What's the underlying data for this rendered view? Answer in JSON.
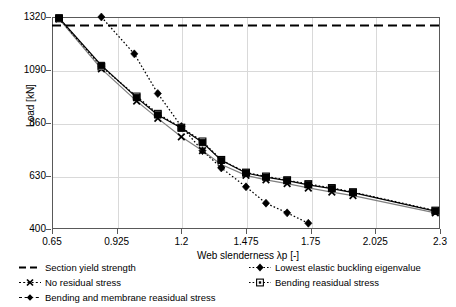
{
  "chart_data": {
    "type": "line",
    "title": "",
    "xlabel": "Web slenderness λp [-]",
    "ylabel": "Load [kN]",
    "xlim": [
      0.65,
      2.3
    ],
    "ylim": [
      400,
      1320
    ],
    "xticks": [
      "0.65",
      "0.925",
      "1.2",
      "1.475",
      "1.75",
      "2.025",
      "2.3"
    ],
    "xtick_values": [
      0.65,
      0.925,
      1.2,
      1.475,
      1.75,
      2.025,
      2.3
    ],
    "yticks": [
      "400",
      "630",
      "860",
      "1090",
      "1320"
    ],
    "ytick_values": [
      400,
      630,
      860,
      1090,
      1320
    ],
    "grid": "horizontal-and-vertical",
    "legend_position": "below-axes",
    "series": [
      {
        "name": "Section yield strength",
        "style": "dashed",
        "marker": "none",
        "color": "#000000",
        "constant_value": 1283,
        "x": [
          0.65,
          2.3
        ],
        "values": [
          1283,
          1283
        ]
      },
      {
        "name": "Lowest elastic buckling eigenvalue",
        "style": "dotted",
        "marker": "diamond",
        "color": "#000000",
        "x": [
          0.86,
          1.0,
          1.1,
          1.2,
          1.29,
          1.37,
          1.475,
          1.56,
          1.65,
          1.74
        ],
        "values": [
          1320,
          1160,
          988,
          845,
          740,
          665,
          583,
          512,
          470,
          425
        ]
      },
      {
        "name": "No residual stress",
        "style": "solid",
        "marker": "x",
        "color": "#7f7f7f",
        "x": [
          0.68,
          0.86,
          1.01,
          1.1,
          1.2,
          1.29,
          1.37,
          1.475,
          1.56,
          1.65,
          1.74,
          1.84,
          1.93,
          2.28
        ],
        "values": [
          1312,
          1095,
          955,
          880,
          800,
          740,
          680,
          633,
          613,
          597,
          578,
          560,
          545,
          470
        ]
      },
      {
        "name": "Bending reasidual stress",
        "style": "dotted",
        "marker": "square-open",
        "color": "#000000",
        "x": [
          0.68,
          0.86,
          1.01,
          1.1,
          1.2,
          1.29,
          1.37,
          1.475,
          1.56,
          1.65,
          1.74,
          1.84,
          1.93,
          2.28
        ],
        "values": [
          1314,
          1105,
          975,
          900,
          840,
          780,
          700,
          645,
          628,
          612,
          595,
          578,
          560,
          480
        ]
      },
      {
        "name": "Bending and membrane reasidual stress",
        "style": "solid",
        "marker": "square-filled",
        "color": "#000000",
        "x": [
          0.68,
          0.86,
          1.01,
          1.1,
          1.2,
          1.29,
          1.37,
          1.475,
          1.56,
          1.65,
          1.74,
          1.84,
          1.93,
          2.28
        ],
        "values": [
          1316,
          1110,
          970,
          895,
          838,
          775,
          698,
          643,
          625,
          610,
          592,
          575,
          558,
          478
        ]
      }
    ]
  },
  "axes": {
    "y_title": "Load [kN]",
    "x_title": "Web slenderness λp [-]",
    "y_labels": [
      "1320",
      "1090",
      "860",
      "630",
      "400"
    ],
    "x_labels": [
      "0.65",
      "0.925",
      "1.2",
      "1.475",
      "1.75",
      "2.025",
      "2.3"
    ]
  },
  "legend": {
    "items": [
      {
        "label": "Section yield strength",
        "key": "dashed-line-key",
        "column": 0,
        "row": 0
      },
      {
        "label": "No residual stress",
        "key": "x-marker-key",
        "column": 0,
        "row": 1
      },
      {
        "label": "Bending and membrane reasidual stress",
        "key": "filled-square-key",
        "column": 0,
        "row": 2
      },
      {
        "label": "Lowest elastic buckling eigenvalue",
        "key": "diamond-marker-key",
        "column": 1,
        "row": 0
      },
      {
        "label": "Bending reasidual stress",
        "key": "open-square-key",
        "column": 1,
        "row": 1
      }
    ]
  },
  "colors": {
    "axis": "#595959",
    "grid": "#d9d9d9",
    "series_black": "#000000",
    "series_gray": "#7f7f7f",
    "background": "#ffffff"
  }
}
